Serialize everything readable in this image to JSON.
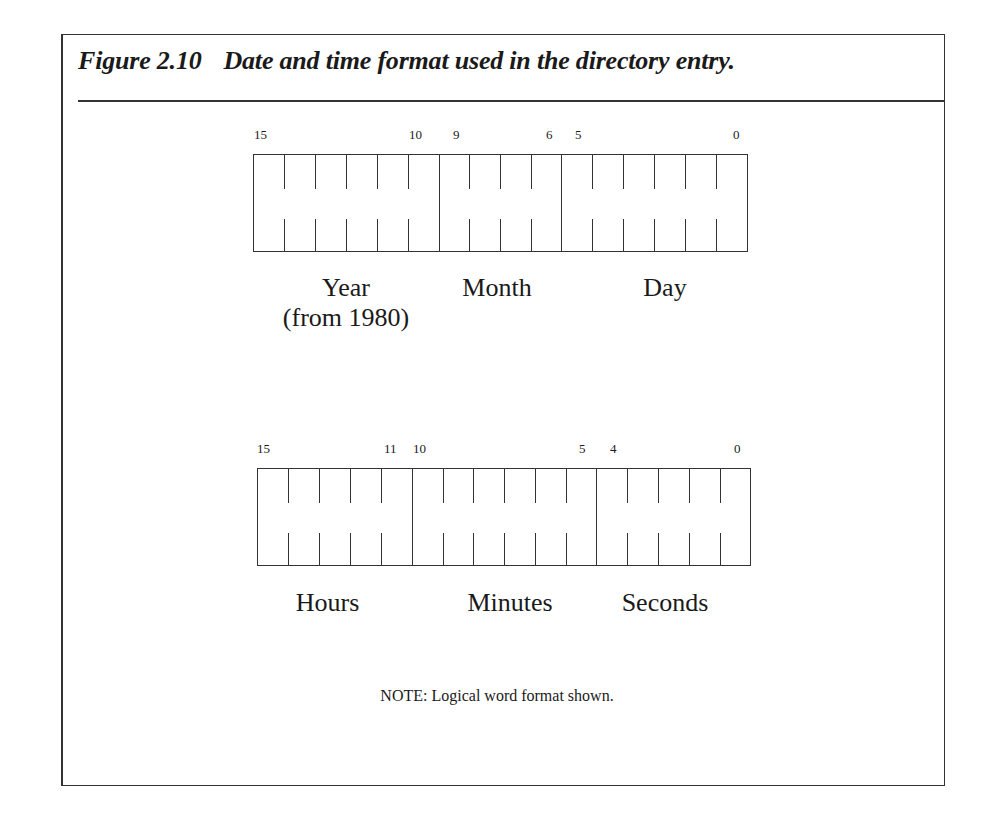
{
  "figure": {
    "number": "Figure 2.10",
    "caption": "Date and time format used in the directory entry."
  },
  "date_register": {
    "bit_labels": [
      "15",
      "10",
      "9",
      "6",
      "5",
      "0"
    ],
    "fields": [
      {
        "name": "Year",
        "sub": "(from 1980)",
        "bits": "15-10"
      },
      {
        "name": "Month",
        "sub": "",
        "bits": "9-6"
      },
      {
        "name": "Day",
        "sub": "",
        "bits": "5-0"
      }
    ]
  },
  "time_register": {
    "bit_labels": [
      "15",
      "11",
      "10",
      "5",
      "4",
      "0"
    ],
    "fields": [
      {
        "name": "Hours",
        "bits": "15-11"
      },
      {
        "name": "Minutes",
        "bits": "10-5"
      },
      {
        "name": "Seconds",
        "bits": "4-0"
      }
    ]
  },
  "note": "NOTE: Logical word format shown."
}
